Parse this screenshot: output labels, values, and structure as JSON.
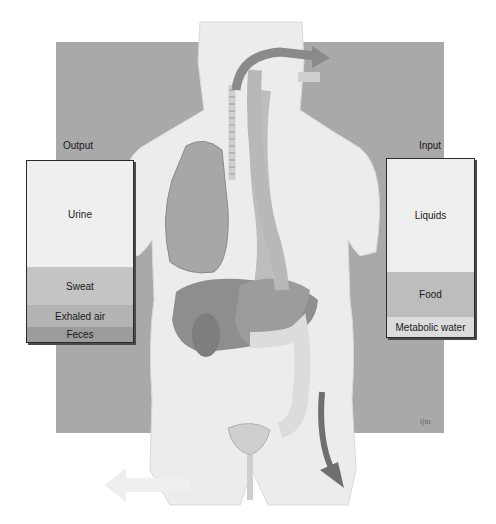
{
  "figure": {
    "background_color": "#a9a9a9",
    "body_color": "#ececec",
    "organ_color": "#8e8e8e",
    "arrow_color": "#7a7a7a"
  },
  "output": {
    "label": "Output",
    "segments": [
      {
        "label": "Urine",
        "color": "#efefef",
        "height": 106
      },
      {
        "label": "Sweat",
        "color": "#c4c4c4",
        "height": 38
      },
      {
        "label": "Exhaled air",
        "color": "#b4b4b4",
        "height": 22
      },
      {
        "label": "Feces",
        "color": "#9c9c9c",
        "height": 15
      }
    ]
  },
  "input": {
    "label": "Input",
    "segments": [
      {
        "label": "Liquids",
        "color": "#efefef",
        "height": 113
      },
      {
        "label": "Food",
        "color": "#bdbdbd",
        "height": 45
      },
      {
        "label": "Metabolic water",
        "color": "#dcdcdc",
        "height": 20
      }
    ]
  },
  "signature": "tjm"
}
